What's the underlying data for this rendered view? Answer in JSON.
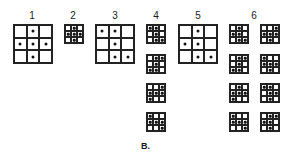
{
  "figure": {
    "caption": "B.",
    "labels": [
      {
        "text": "1",
        "x": 32
      },
      {
        "text": "2",
        "x": 73
      },
      {
        "text": "3",
        "x": 115
      },
      {
        "text": "4",
        "x": 156
      },
      {
        "text": "5",
        "x": 198
      },
      {
        "text": "6",
        "x": 254
      }
    ],
    "grids": [
      {
        "group": "1",
        "size": "big",
        "x": 13,
        "y": 24,
        "w": 40,
        "dots": [
          [
            0,
            1
          ],
          [
            1,
            0
          ],
          [
            1,
            1
          ],
          [
            1,
            2
          ],
          [
            2,
            1
          ]
        ]
      },
      {
        "group": "2",
        "size": "small",
        "x": 64,
        "y": 24,
        "w": 20,
        "dots": [
          [
            0,
            1
          ],
          [
            1,
            0
          ],
          [
            1,
            1
          ],
          [
            1,
            2
          ],
          [
            2,
            1
          ]
        ]
      },
      {
        "group": "3",
        "size": "big",
        "x": 95,
        "y": 24,
        "w": 40,
        "dots": [
          [
            0,
            0
          ],
          [
            0,
            1
          ],
          [
            1,
            1
          ],
          [
            2,
            1
          ],
          [
            2,
            2
          ]
        ]
      },
      {
        "group": "4",
        "size": "small",
        "x": 146,
        "y": 24,
        "w": 20,
        "dots": [
          [
            0,
            0
          ],
          [
            0,
            1
          ],
          [
            1,
            1
          ],
          [
            2,
            1
          ],
          [
            2,
            2
          ]
        ]
      },
      {
        "group": "4",
        "size": "small",
        "x": 146,
        "y": 54,
        "w": 20,
        "dots": [
          [
            0,
            1
          ],
          [
            0,
            2
          ],
          [
            1,
            1
          ],
          [
            2,
            0
          ],
          [
            2,
            1
          ]
        ]
      },
      {
        "group": "4",
        "size": "small",
        "x": 146,
        "y": 83,
        "w": 20,
        "dots": [
          [
            0,
            2
          ],
          [
            1,
            0
          ],
          [
            1,
            1
          ],
          [
            1,
            2
          ],
          [
            2,
            0
          ]
        ]
      },
      {
        "group": "4",
        "size": "small",
        "x": 146,
        "y": 112,
        "w": 20,
        "dots": [
          [
            0,
            0
          ],
          [
            1,
            0
          ],
          [
            1,
            1
          ],
          [
            1,
            2
          ],
          [
            2,
            2
          ]
        ]
      },
      {
        "group": "5",
        "size": "big",
        "x": 178,
        "y": 24,
        "w": 40,
        "dots": [
          [
            0,
            1
          ],
          [
            1,
            0
          ],
          [
            1,
            1
          ],
          [
            2,
            1
          ],
          [
            2,
            2
          ]
        ]
      },
      {
        "group": "6",
        "size": "small",
        "x": 229,
        "y": 24,
        "w": 20,
        "dots": [
          [
            0,
            1
          ],
          [
            1,
            0
          ],
          [
            1,
            1
          ],
          [
            2,
            1
          ],
          [
            2,
            2
          ]
        ]
      },
      {
        "group": "6",
        "size": "small",
        "x": 260,
        "y": 24,
        "w": 20,
        "dots": [
          [
            0,
            2
          ],
          [
            1,
            0
          ],
          [
            1,
            1
          ],
          [
            1,
            2
          ],
          [
            2,
            1
          ]
        ]
      },
      {
        "group": "6",
        "size": "small",
        "x": 229,
        "y": 54,
        "w": 20,
        "dots": [
          [
            0,
            1
          ],
          [
            0,
            2
          ],
          [
            1,
            1
          ],
          [
            2,
            0
          ],
          [
            2,
            1
          ]
        ]
      },
      {
        "group": "6",
        "size": "small",
        "x": 260,
        "y": 54,
        "w": 20,
        "dots": [
          [
            0,
            0
          ],
          [
            1,
            0
          ],
          [
            1,
            1
          ],
          [
            1,
            2
          ],
          [
            2,
            1
          ]
        ]
      },
      {
        "group": "6",
        "size": "small",
        "x": 229,
        "y": 83,
        "w": 20,
        "dots": [
          [
            0,
            1
          ],
          [
            1,
            0
          ],
          [
            1,
            1
          ],
          [
            1,
            2
          ],
          [
            2,
            0
          ]
        ]
      },
      {
        "group": "6",
        "size": "small",
        "x": 260,
        "y": 83,
        "w": 20,
        "dots": [
          [
            0,
            0
          ],
          [
            0,
            1
          ],
          [
            1,
            1
          ],
          [
            1,
            2
          ],
          [
            2,
            1
          ]
        ]
      },
      {
        "group": "6",
        "size": "small",
        "x": 229,
        "y": 112,
        "w": 20,
        "dots": [
          [
            0,
            0
          ],
          [
            1,
            0
          ],
          [
            1,
            1
          ],
          [
            1,
            2
          ],
          [
            2,
            2
          ]
        ]
      },
      {
        "group": "6",
        "size": "small",
        "x": 260,
        "y": 112,
        "w": 20,
        "dots": [
          [
            0,
            1
          ],
          [
            0,
            2
          ],
          [
            1,
            0
          ],
          [
            1,
            1
          ],
          [
            2,
            1
          ]
        ]
      }
    ]
  }
}
